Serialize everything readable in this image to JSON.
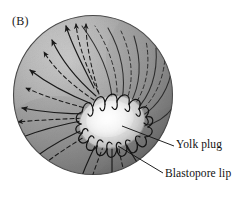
{
  "figure": {
    "panel_label": "(B)",
    "background_color": "#ffffff",
    "ink_color": "#1a1a1a"
  },
  "sphere": {
    "name": "embryo-sphere",
    "center_x": 93,
    "center_y": 95,
    "radius": 80,
    "shade_light": "#cfcfcf",
    "shade_mid": "#a3a3a3",
    "shade_dark": "#6e6e6e",
    "outline_color": "#3a3a3a"
  },
  "yolk_plug": {
    "name": "yolk-plug",
    "center_x": 112,
    "center_y": 122,
    "radius_x": 32,
    "radius_y": 25,
    "rotation_deg": -12,
    "highlight_color": "#f2f2f2",
    "edge_color": "#b5b5b5"
  },
  "blastopore_lip": {
    "name": "blastopore-lip",
    "scallop_count": 18,
    "color": "#1d1d1d"
  },
  "flow_arrows": {
    "name": "involution-flow-arrows",
    "solid_count": 9,
    "dashed_count": 8,
    "arrowhead_side": "left",
    "color": "#1a1a1a",
    "dash_pattern": "4 3"
  },
  "callouts": [
    {
      "id": "yolk-plug",
      "label": "Yolk plug",
      "leader_from_x": 174,
      "leader_from_y": 146,
      "leader_to_x": 122,
      "leader_to_y": 126
    },
    {
      "id": "blastopore-lip",
      "label": "Blastopore lip",
      "leader_from_x": 163,
      "leader_from_y": 173,
      "leader_to_x": 118,
      "leader_to_y": 146
    }
  ]
}
